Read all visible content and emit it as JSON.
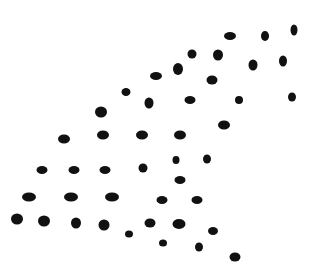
{
  "image": {
    "width": 312,
    "height": 269,
    "background": "#ffffff",
    "dot_color": "#111111",
    "description": "Field of black elliptical dots arranged in a rough triangular pattern on white"
  },
  "dots": [
    {
      "cx": 230,
      "cy": 36,
      "rx": 6,
      "ry": 4
    },
    {
      "cx": 265,
      "cy": 36,
      "rx": 4,
      "ry": 5
    },
    {
      "cx": 294,
      "cy": 30,
      "rx": 3.5,
      "ry": 5.5
    },
    {
      "cx": 192,
      "cy": 54,
      "rx": 4.5,
      "ry": 4.5
    },
    {
      "cx": 218,
      "cy": 55,
      "rx": 5,
      "ry": 5.5
    },
    {
      "cx": 156,
      "cy": 76,
      "rx": 6,
      "ry": 4
    },
    {
      "cx": 178,
      "cy": 69,
      "rx": 5,
      "ry": 6
    },
    {
      "cx": 253,
      "cy": 65,
      "rx": 4.5,
      "ry": 5.5
    },
    {
      "cx": 283,
      "cy": 61,
      "rx": 4,
      "ry": 5.5
    },
    {
      "cx": 212,
      "cy": 80,
      "rx": 5.5,
      "ry": 4.5
    },
    {
      "cx": 126,
      "cy": 92,
      "rx": 4.5,
      "ry": 4
    },
    {
      "cx": 149,
      "cy": 103,
      "rx": 4.5,
      "ry": 5.5
    },
    {
      "cx": 190,
      "cy": 100,
      "rx": 5.5,
      "ry": 4
    },
    {
      "cx": 239,
      "cy": 100,
      "rx": 4,
      "ry": 4
    },
    {
      "cx": 292,
      "cy": 97,
      "rx": 4,
      "ry": 4.5
    },
    {
      "cx": 101,
      "cy": 112,
      "rx": 6,
      "ry": 5.5
    },
    {
      "cx": 224,
      "cy": 125,
      "rx": 6,
      "ry": 4.5
    },
    {
      "cx": 64,
      "cy": 139,
      "rx": 6,
      "ry": 4.5
    },
    {
      "cx": 103,
      "cy": 135,
      "rx": 6,
      "ry": 4.5
    },
    {
      "cx": 142,
      "cy": 135,
      "rx": 6,
      "ry": 4.5
    },
    {
      "cx": 180,
      "cy": 135,
      "rx": 6,
      "ry": 4.5
    },
    {
      "cx": 176,
      "cy": 160,
      "rx": 3.5,
      "ry": 4
    },
    {
      "cx": 207,
      "cy": 159,
      "rx": 4,
      "ry": 4.5
    },
    {
      "cx": 42,
      "cy": 170,
      "rx": 5.5,
      "ry": 4
    },
    {
      "cx": 74,
      "cy": 170,
      "rx": 5.5,
      "ry": 4
    },
    {
      "cx": 105,
      "cy": 170,
      "rx": 5.5,
      "ry": 4
    },
    {
      "cx": 143,
      "cy": 168,
      "rx": 4.5,
      "ry": 4.5
    },
    {
      "cx": 180,
      "cy": 180,
      "rx": 5.5,
      "ry": 4
    },
    {
      "cx": 29,
      "cy": 197,
      "rx": 7,
      "ry": 4.5
    },
    {
      "cx": 71,
      "cy": 197,
      "rx": 7,
      "ry": 4.5
    },
    {
      "cx": 112,
      "cy": 197,
      "rx": 7,
      "ry": 4.5
    },
    {
      "cx": 162,
      "cy": 200,
      "rx": 5.5,
      "ry": 4
    },
    {
      "cx": 197,
      "cy": 200,
      "rx": 5.5,
      "ry": 4
    },
    {
      "cx": 17,
      "cy": 219,
      "rx": 6,
      "ry": 5.5
    },
    {
      "cx": 44,
      "cy": 221,
      "rx": 6,
      "ry": 5.5
    },
    {
      "cx": 76,
      "cy": 223,
      "rx": 5,
      "ry": 5.5
    },
    {
      "cx": 104,
      "cy": 225,
      "rx": 5.5,
      "ry": 5.5
    },
    {
      "cx": 129,
      "cy": 234,
      "rx": 4,
      "ry": 3.5
    },
    {
      "cx": 150,
      "cy": 223,
      "rx": 5.5,
      "ry": 4.5
    },
    {
      "cx": 179,
      "cy": 224,
      "rx": 6.5,
      "ry": 5
    },
    {
      "cx": 213,
      "cy": 231,
      "rx": 5,
      "ry": 4
    },
    {
      "cx": 163,
      "cy": 243,
      "rx": 4,
      "ry": 3.5
    },
    {
      "cx": 199,
      "cy": 247,
      "rx": 4,
      "ry": 4.5
    },
    {
      "cx": 235,
      "cy": 257,
      "rx": 5.5,
      "ry": 4.5
    }
  ]
}
